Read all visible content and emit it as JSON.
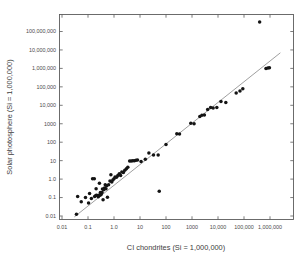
{
  "chart_data": {
    "type": "scatter",
    "title": "",
    "subtitle": "",
    "xlabel": "CI chondrites (Si = 1,000,000)",
    "ylabel": "Solar photosphere (Si = 1,000,000)",
    "xscale": "log",
    "yscale": "log",
    "xlim": [
      0.0032,
      10000000
    ],
    "ylim": [
      0.01,
      1000000000
    ],
    "grid": false,
    "legend": null,
    "xticks": [
      0.01,
      0.1,
      1.0,
      10,
      100,
      1000,
      10000,
      100000,
      1000000
    ],
    "xtick_labels": [
      "0.01",
      "0.1",
      "1.0",
      "10",
      "100",
      "1000",
      "10,000",
      "100,000",
      "1,000,000"
    ],
    "yticks": [
      0.01,
      0.1,
      1.0,
      10,
      100,
      1000,
      10000,
      100000,
      1000000,
      10000000,
      100000000
    ],
    "ytick_labels": [
      "0.01",
      "0.1",
      "1.0",
      "10",
      "100",
      "1000",
      "10,000",
      "100,000",
      "1,000,000",
      "10,000,000",
      "100,000,000"
    ],
    "series": [
      {
        "name": "Elements",
        "marker": "filled-circle",
        "color": "#141414",
        "points": [
          [
            0.036,
            0.0125
          ],
          [
            0.04,
            0.115
          ],
          [
            0.055,
            0.06
          ],
          [
            0.08,
            0.1
          ],
          [
            0.105,
            0.05
          ],
          [
            0.115,
            0.165
          ],
          [
            0.135,
            0.09
          ],
          [
            0.15,
            1.05
          ],
          [
            0.175,
            1.05
          ],
          [
            0.18,
            0.115
          ],
          [
            0.2,
            0.13
          ],
          [
            0.205,
            0.3
          ],
          [
            0.215,
            0.135
          ],
          [
            0.235,
            0.125
          ],
          [
            0.25,
            0.11
          ],
          [
            0.26,
            0.135
          ],
          [
            0.275,
            0.6
          ],
          [
            0.29,
            0.135
          ],
          [
            0.3,
            0.185
          ],
          [
            0.32,
            0.145
          ],
          [
            0.345,
            0.185
          ],
          [
            0.36,
            0.29
          ],
          [
            0.38,
            0.075
          ],
          [
            0.4,
            0.265
          ],
          [
            0.43,
            0.33
          ],
          [
            0.46,
            0.5
          ],
          [
            0.49,
            0.3
          ],
          [
            0.52,
            0.44
          ],
          [
            0.56,
            0.105
          ],
          [
            0.62,
            0.5
          ],
          [
            0.7,
            0.79
          ],
          [
            0.76,
            1.7
          ],
          [
            0.82,
            0.7
          ],
          [
            0.9,
            0.88
          ],
          [
            1.0,
            1.05
          ],
          [
            1.1,
            1.3
          ],
          [
            1.25,
            1.25
          ],
          [
            1.4,
            1.55
          ],
          [
            1.6,
            1.95
          ],
          [
            1.8,
            1.55
          ],
          [
            2.0,
            2.4
          ],
          [
            2.3,
            2.3
          ],
          [
            2.6,
            3.0
          ],
          [
            3.0,
            3.6
          ],
          [
            3.4,
            4.4
          ],
          [
            4.0,
            9.5
          ],
          [
            4.6,
            9.5
          ],
          [
            5.3,
            9.8
          ],
          [
            6.1,
            10.0
          ],
          [
            7.0,
            10.5
          ],
          [
            8.0,
            11.0
          ],
          [
            11.0,
            9.0
          ],
          [
            16.0,
            12.0
          ],
          [
            22.0,
            26.0
          ],
          [
            33.0,
            20.5
          ],
          [
            50.0,
            20.0
          ],
          [
            55.0,
            0.22
          ],
          [
            100,
            75
          ],
          [
            260,
            290
          ],
          [
            330,
            280
          ],
          [
            900,
            1050
          ],
          [
            1200,
            1000
          ],
          [
            2000,
            2500
          ],
          [
            2400,
            2900
          ],
          [
            3000,
            3000
          ],
          [
            4000,
            6000
          ],
          [
            5200,
            7500
          ],
          [
            6500,
            7200
          ],
          [
            9000,
            7500
          ],
          [
            13000,
            16000
          ],
          [
            20000,
            14000
          ],
          [
            50000,
            47000
          ],
          [
            70000,
            60000
          ],
          [
            90000,
            78000
          ],
          [
            400000,
            330000000
          ],
          [
            700000,
            1000000
          ],
          [
            830000,
            1050000
          ],
          [
            950000,
            1080000
          ]
        ]
      }
    ],
    "annotations": [
      {
        "kind": "reference-line",
        "label": "1:1 correspondence line",
        "from": [
          0.03,
          0.009
        ],
        "to": [
          2500000,
          7000000
        ]
      }
    ]
  },
  "axes": {
    "x_title": "CI chondrites (Si = 1,000,000)",
    "y_title": "Solar photosphere (Si = 1,000,000)"
  }
}
